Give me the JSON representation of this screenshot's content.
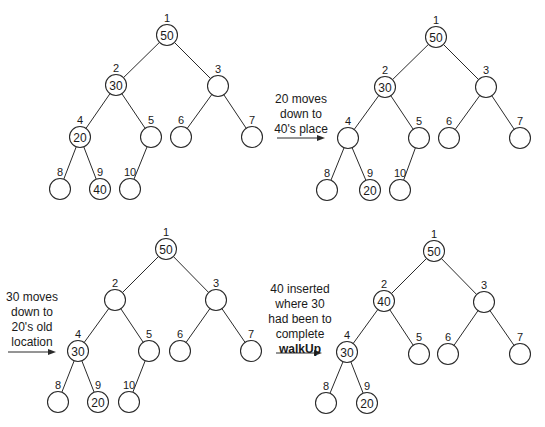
{
  "figure": {
    "panels": [
      {
        "id": "panel-1",
        "values": {
          "1": "50",
          "2": "30",
          "4": "20",
          "9": "40"
        },
        "nodes": [
          1,
          2,
          3,
          4,
          5,
          6,
          7,
          8,
          9,
          10
        ]
      },
      {
        "id": "panel-2",
        "caption": [
          "20 moves",
          "down to",
          "40's place"
        ],
        "values": {
          "1": "50",
          "2": "30",
          "9": "20"
        },
        "nodes": [
          1,
          2,
          3,
          4,
          5,
          6,
          7,
          8,
          9,
          10
        ]
      },
      {
        "id": "panel-3",
        "caption": [
          "30 moves",
          "down to",
          "20's old",
          "location"
        ],
        "values": {
          "1": "50",
          "4": "30",
          "9": "20"
        },
        "nodes": [
          1,
          2,
          3,
          4,
          5,
          6,
          7,
          8,
          9,
          10
        ]
      },
      {
        "id": "panel-4",
        "caption": [
          "40 inserted",
          "where 30",
          "had been to",
          "complete",
          "walkUp"
        ],
        "caption_bold_last": true,
        "values": {
          "1": "50",
          "2": "40",
          "4": "30",
          "9": "20"
        },
        "nodes": [
          1,
          2,
          3,
          4,
          5,
          6,
          7,
          8,
          9
        ]
      }
    ]
  },
  "captions": {
    "c2": {
      "l1": "20 moves",
      "l2": "down to",
      "l3": "40's place"
    },
    "c3": {
      "l1": "30 moves",
      "l2": "down to",
      "l3": "20's old",
      "l4": "location"
    },
    "c4": {
      "l1": "40 inserted",
      "l2": "where 30",
      "l3": "had been to",
      "l4": "complete",
      "l5": "walkUp"
    }
  },
  "colors": {
    "stroke": "#2a2a2a",
    "background": "#ffffff",
    "text": "#1a1a1a"
  }
}
